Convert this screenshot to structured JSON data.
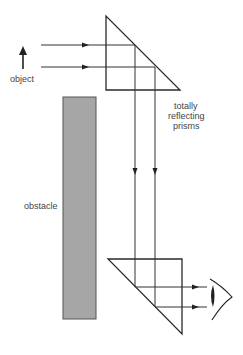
{
  "labels": {
    "object": "object",
    "prisms_line1": "totally",
    "prisms_line2": "reflecting",
    "prisms_line3": "prisms",
    "obstacle": "obstacle"
  },
  "colors": {
    "line": "#333333",
    "obstacle_fill": "#a6a6a6",
    "obstacle_stroke": "#555555",
    "text": "#444444",
    "background": "#ffffff"
  },
  "components": [
    {
      "name": "object-arrow",
      "description": "upward arrow representing the object"
    },
    {
      "name": "top-prism",
      "description": "right-angle prism reflecting light downward"
    },
    {
      "name": "obstacle",
      "description": "gray rectangular wall blocking direct view"
    },
    {
      "name": "bottom-prism",
      "description": "right-angle prism reflecting light toward the eye"
    },
    {
      "name": "eye",
      "description": "observer's eye"
    }
  ]
}
